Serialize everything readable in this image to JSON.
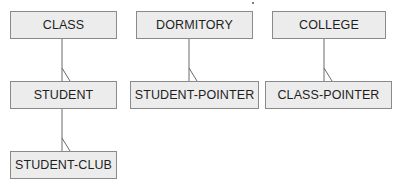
{
  "diagram": {
    "type": "hierarchical-record-structure",
    "colors": {
      "box_fill": "#ececec",
      "box_border": "#8a8a8a",
      "line": "#6a6a6a",
      "text": "#1e1e1e"
    },
    "nodes": [
      {
        "id": "class",
        "label": "CLASS"
      },
      {
        "id": "student",
        "label": "STUDENT"
      },
      {
        "id": "student_club",
        "label": "STUDENT-CLUB"
      },
      {
        "id": "dormitory",
        "label": "DORMITORY"
      },
      {
        "id": "student_pointer",
        "label": "STUDENT-POINTER"
      },
      {
        "id": "college",
        "label": "COLLEGE"
      },
      {
        "id": "class_pointer",
        "label": "CLASS-POINTER"
      }
    ],
    "edges": [
      {
        "from": "class",
        "to": "student",
        "cardinality": "one-to-many"
      },
      {
        "from": "student",
        "to": "student_club",
        "cardinality": "one-to-many"
      },
      {
        "from": "dormitory",
        "to": "student_pointer",
        "cardinality": "one-to-many"
      },
      {
        "from": "college",
        "to": "class_pointer",
        "cardinality": "one-to-many"
      }
    ]
  }
}
